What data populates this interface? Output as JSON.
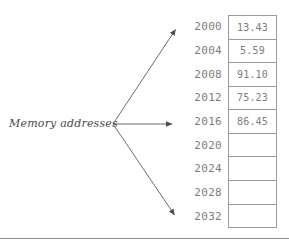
{
  "diagram": {
    "caption": "Memory addresses",
    "addresses": [
      "2000",
      "2004",
      "2008",
      "2012",
      "2016",
      "2020",
      "2024",
      "2028",
      "2032"
    ],
    "cells": [
      {
        "address": "2000",
        "value": "13.43"
      },
      {
        "address": "2004",
        "value": "5.59"
      },
      {
        "address": "2008",
        "value": "91.10"
      },
      {
        "address": "2012",
        "value": "75.23"
      },
      {
        "address": "2016",
        "value": "86.45"
      },
      {
        "address": "2020",
        "value": ""
      },
      {
        "address": "2024",
        "value": ""
      },
      {
        "address": "2028",
        "value": ""
      },
      {
        "address": "2032",
        "value": ""
      }
    ],
    "arrows": [
      {
        "name": "arrow-to-2000",
        "target_address": "2000"
      },
      {
        "name": "arrow-to-2016",
        "target_address": "2016"
      },
      {
        "name": "arrow-to-2032",
        "target_address": "2032"
      }
    ],
    "colors": {
      "text": "#4a4a4a",
      "address_text": "#7d7d7d",
      "value_text": "#7d7d7d",
      "border": "#9a9a9a",
      "arrow": "#6e6e6e",
      "background": "#ffffff",
      "footer_rule": "#8d8d8d"
    }
  }
}
